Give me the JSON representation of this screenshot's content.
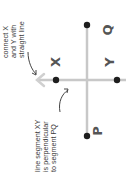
{
  "diagram": {
    "rotation_deg": -90,
    "colors": {
      "line": "#c8c8c8",
      "extension": "#d0d0d0",
      "dot": "#1e1e1e",
      "label": "#555555",
      "note": "#3a3a3a",
      "arrow": "#444444"
    },
    "points": {
      "X": {
        "label": "X"
      },
      "Y": {
        "label": "Y"
      },
      "P": {
        "label": "P"
      },
      "Q": {
        "label": "Q"
      }
    },
    "notes": {
      "connect": {
        "lines": [
          "connect X",
          "and Y with",
          "straight line"
        ]
      },
      "perpendicular": {
        "lines": [
          "line segment XY",
          "is perpendicular",
          "to segment PQ"
        ]
      }
    }
  }
}
